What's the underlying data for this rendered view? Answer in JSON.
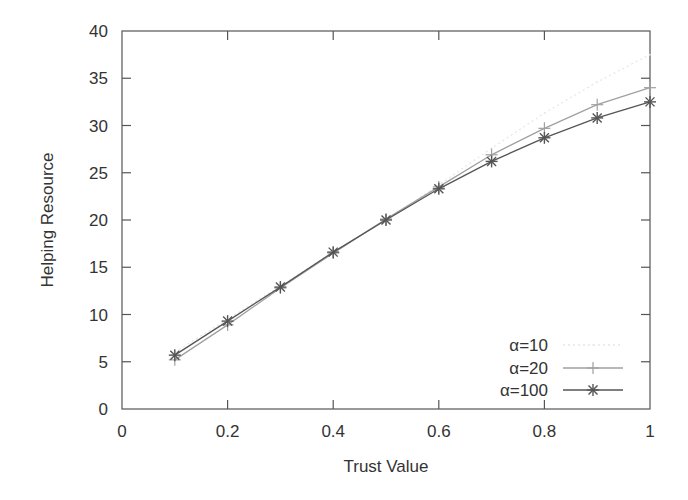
{
  "chart_data": {
    "type": "line",
    "title": "",
    "xlabel": "Trust Value",
    "ylabel": "Helping Resource",
    "xlim": [
      0,
      1
    ],
    "ylim": [
      0,
      40
    ],
    "xticks": [
      0,
      0.2,
      0.4,
      0.6,
      0.8,
      1
    ],
    "xtick_labels": [
      "0",
      "0.2",
      "0.4",
      "0.6",
      "0.8",
      "1"
    ],
    "yticks": [
      0,
      5,
      10,
      15,
      20,
      25,
      30,
      35,
      40
    ],
    "ytick_labels": [
      "0",
      "5",
      "10",
      "15",
      "20",
      "25",
      "30",
      "35",
      "40"
    ],
    "grid": false,
    "legend_position": "lower right",
    "x": [
      0.1,
      0.2,
      0.3,
      0.4,
      0.5,
      0.6,
      0.7,
      0.8,
      0.9,
      1.0
    ],
    "series": [
      {
        "name": "α=10",
        "marker": "dot",
        "color": "#e6e6e6",
        "values": [
          6.0,
          9.5,
          13.0,
          16.6,
          20.0,
          23.7,
          27.6,
          31.3,
          34.6,
          37.5
        ]
      },
      {
        "name": "α=20",
        "marker": "plus",
        "color": "#a0a0a0",
        "values": [
          5.2,
          8.9,
          12.8,
          16.5,
          20.1,
          23.5,
          26.9,
          29.7,
          32.2,
          34.0
        ]
      },
      {
        "name": "α=100",
        "marker": "star",
        "color": "#555555",
        "values": [
          5.7,
          9.3,
          12.9,
          16.6,
          20.0,
          23.3,
          26.2,
          28.7,
          30.8,
          32.5
        ]
      }
    ]
  }
}
